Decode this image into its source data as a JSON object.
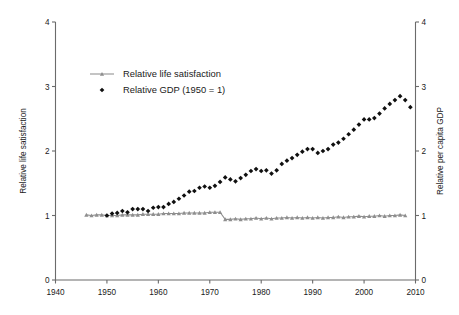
{
  "chart_data": {
    "type": "line",
    "title": "",
    "subtitle": "",
    "xlabel": "",
    "ylabel": "Relative life satisfaction",
    "y2label": "Relative per capita GDP",
    "xlim": [
      1940,
      2010
    ],
    "ylim": [
      0,
      4
    ],
    "y2lim": [
      0,
      4
    ],
    "xticks": [
      1940,
      1950,
      1960,
      1970,
      1980,
      1990,
      2000,
      2010
    ],
    "xticklabels": [
      "1940",
      "1950",
      "1960",
      "1970",
      "1980",
      "1990",
      "2000",
      "2010"
    ],
    "yticks": [
      0,
      1,
      2,
      3,
      4
    ],
    "yticklabels": [
      "0",
      "1",
      "2",
      "3",
      "4"
    ],
    "y2ticks": [
      0,
      1,
      2,
      3,
      4
    ],
    "y2ticklabels": [
      "0",
      "1",
      "2",
      "3",
      "4"
    ],
    "grid": false,
    "legend_position": "upper-left-inside",
    "series": [
      {
        "name": "Relative life satisfaction",
        "axis": "left",
        "style": "line-marker",
        "color": "#8e8e8e",
        "marker": "triangle",
        "x": [
          1946,
          1947,
          1948,
          1949,
          1950,
          1951,
          1952,
          1953,
          1954,
          1955,
          1956,
          1957,
          1958,
          1959,
          1960,
          1961,
          1962,
          1963,
          1964,
          1965,
          1966,
          1967,
          1968,
          1969,
          1970,
          1971,
          1972,
          1973,
          1974,
          1975,
          1976,
          1977,
          1978,
          1979,
          1980,
          1981,
          1982,
          1983,
          1984,
          1985,
          1986,
          1987,
          1988,
          1989,
          1990,
          1991,
          1992,
          1993,
          1994,
          1995,
          1996,
          1997,
          1998,
          1999,
          2000,
          2001,
          2002,
          2003,
          2004,
          2005,
          2006,
          2007,
          2008
        ],
        "y": [
          1.01,
          1.0,
          1.01,
          1.01,
          1.0,
          1.0,
          1.0,
          1.01,
          1.01,
          1.01,
          1.01,
          1.02,
          1.02,
          1.02,
          1.02,
          1.03,
          1.03,
          1.03,
          1.03,
          1.04,
          1.04,
          1.04,
          1.04,
          1.04,
          1.05,
          1.05,
          1.05,
          0.94,
          0.94,
          0.95,
          0.94,
          0.95,
          0.95,
          0.96,
          0.95,
          0.96,
          0.95,
          0.96,
          0.96,
          0.97,
          0.96,
          0.97,
          0.96,
          0.97,
          0.96,
          0.97,
          0.96,
          0.97,
          0.97,
          0.98,
          0.97,
          0.98,
          0.98,
          0.99,
          0.98,
          0.99,
          0.99,
          1.0,
          0.99,
          1.0,
          1.0,
          1.01,
          1.0
        ]
      },
      {
        "name": "Relative GDP (1950 = 1)",
        "axis": "right",
        "style": "scatter",
        "color": "#101010",
        "marker": "diamond",
        "x": [
          1950,
          1951,
          1952,
          1953,
          1954,
          1955,
          1956,
          1957,
          1958,
          1959,
          1960,
          1961,
          1962,
          1963,
          1964,
          1965,
          1966,
          1967,
          1968,
          1969,
          1970,
          1971,
          1972,
          1973,
          1974,
          1975,
          1976,
          1977,
          1978,
          1979,
          1980,
          1981,
          1982,
          1983,
          1984,
          1985,
          1986,
          1987,
          1988,
          1989,
          1990,
          1991,
          1992,
          1993,
          1994,
          1995,
          1996,
          1997,
          1998,
          1999,
          2000,
          2001,
          2002,
          2003,
          2004,
          2005,
          2006,
          2007,
          2008,
          2009
        ],
        "y": [
          1.0,
          1.03,
          1.04,
          1.07,
          1.05,
          1.1,
          1.1,
          1.1,
          1.07,
          1.12,
          1.13,
          1.13,
          1.18,
          1.21,
          1.26,
          1.31,
          1.37,
          1.38,
          1.43,
          1.45,
          1.43,
          1.46,
          1.52,
          1.59,
          1.56,
          1.53,
          1.58,
          1.63,
          1.69,
          1.72,
          1.69,
          1.7,
          1.65,
          1.7,
          1.8,
          1.85,
          1.89,
          1.94,
          1.99,
          2.03,
          2.03,
          1.97,
          2.0,
          2.03,
          2.1,
          2.13,
          2.19,
          2.26,
          2.33,
          2.41,
          2.49,
          2.49,
          2.51,
          2.58,
          2.66,
          2.73,
          2.79,
          2.85,
          2.79,
          2.68
        ]
      }
    ],
    "legend_entries": [
      {
        "label": "Relative life satisfaction",
        "marker": "line-triangle",
        "color": "#8e8e8e"
      },
      {
        "label": "Relative GDP (1950 = 1)",
        "marker": "diamond",
        "color": "#101010"
      }
    ]
  }
}
